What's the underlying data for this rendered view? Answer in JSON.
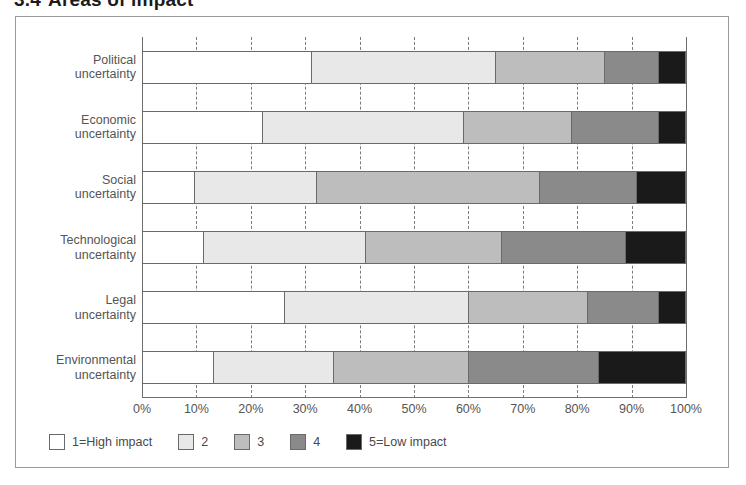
{
  "figure": {
    "number": "3.4",
    "title": "Areas of impact"
  },
  "chart_data": {
    "type": "bar",
    "orientation": "horizontal",
    "stacked": true,
    "normalized": true,
    "title": "Areas of impact",
    "xlabel": "",
    "ylabel": "",
    "xlim": [
      0,
      100
    ],
    "grid": true,
    "grid_axis": "x",
    "legend_position": "bottom-left",
    "categories": [
      "Political uncertainty",
      "Economic uncertainty",
      "Social uncertainty",
      "Technological uncertainty",
      "Legal uncertainty",
      "Environmental uncertainty"
    ],
    "category_lines": [
      [
        "Political",
        "uncertainty"
      ],
      [
        "Economic",
        "uncertainty"
      ],
      [
        "Social",
        "uncertainty"
      ],
      [
        "Technological",
        "uncertainty"
      ],
      [
        "Legal",
        "uncertainty"
      ],
      [
        "Environmental",
        "uncertainty"
      ]
    ],
    "tick_labels": [
      "0%",
      "10%",
      "20%",
      "30%",
      "40%",
      "50%",
      "60%",
      "70%",
      "80%",
      "90%",
      "100%"
    ],
    "tick_values": [
      0,
      10,
      20,
      30,
      40,
      50,
      60,
      70,
      80,
      90,
      100
    ],
    "series": [
      {
        "name": "1=High impact",
        "level": 1,
        "color": "#ffffff",
        "values": [
          31,
          22,
          9.5,
          11,
          26,
          13
        ]
      },
      {
        "name": "2",
        "level": 2,
        "color": "#e8e8e8",
        "values": [
          34,
          37,
          22.5,
          30,
          34,
          22
        ]
      },
      {
        "name": "3",
        "level": 3,
        "color": "#bdbdbd",
        "values": [
          20,
          20,
          41,
          25,
          22,
          25
        ]
      },
      {
        "name": "4",
        "level": 4,
        "color": "#8a8a8a",
        "values": [
          10,
          16,
          18,
          23,
          13,
          24
        ]
      },
      {
        "name": "5=Low impact",
        "level": 5,
        "color": "#1a1a1a",
        "values": [
          5,
          5,
          9,
          11,
          5,
          16
        ]
      }
    ]
  },
  "legend": {
    "items": [
      {
        "label": "1=High impact",
        "color": "#ffffff"
      },
      {
        "label": "2",
        "color": "#e8e8e8"
      },
      {
        "label": "3",
        "color": "#bdbdbd"
      },
      {
        "label": "4",
        "color": "#8a8a8a"
      },
      {
        "label": "5=Low impact",
        "color": "#1a1a1a"
      }
    ]
  }
}
